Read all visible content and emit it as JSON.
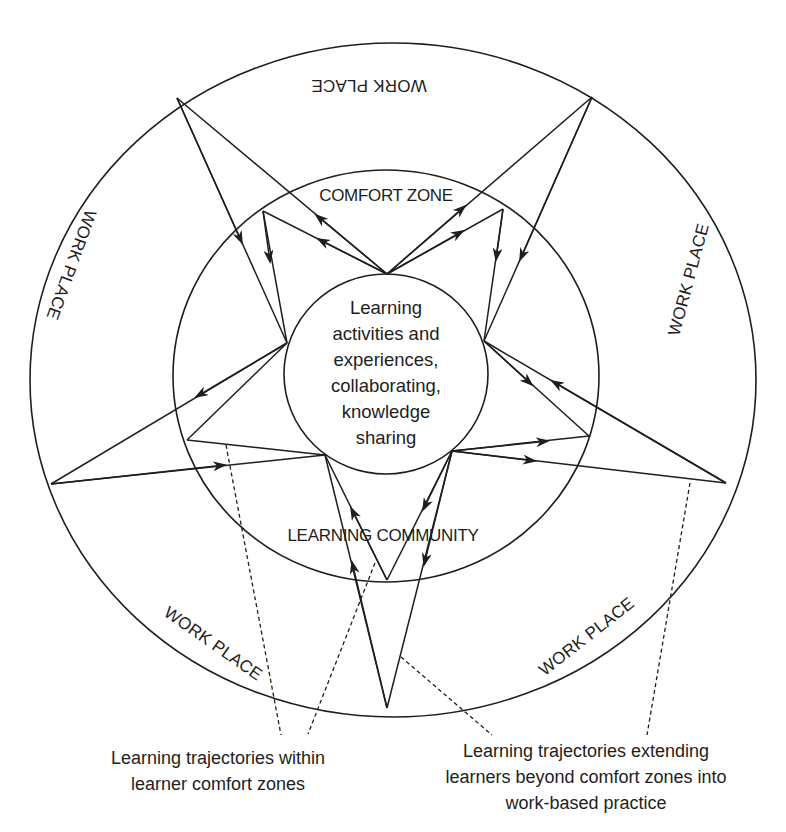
{
  "diagram": {
    "center_text": [
      "Learning",
      "activities and",
      "experiences,",
      "collaborating,",
      "knowledge",
      "sharing"
    ],
    "zones": {
      "comfort_zone": "COMFORT ZONE",
      "learning_community": "LEARNING COMMUNITY",
      "work_place_top": "WORK PLACE",
      "work_place_left": "WORK PLACE",
      "work_place_right": "WORK PLACE",
      "work_place_bottom_left": "WORK PLACE",
      "work_place_bottom_right": "WORK PLACE"
    },
    "captions": {
      "within": [
        "Learning trajectories within",
        "learner comfort zones"
      ],
      "extending": [
        "Learning trajectories extending",
        "learners beyond comfort zones into",
        "work-based practice"
      ]
    }
  }
}
